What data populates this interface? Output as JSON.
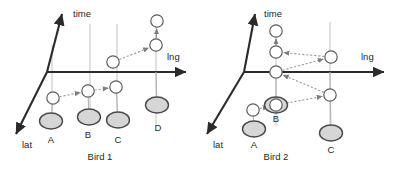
{
  "figure": {
    "title": "",
    "panels": [
      {
        "id": "bird-1",
        "caption": "Bird 1",
        "caption_pos": [
          100,
          160
        ],
        "origin": [
          47,
          72
        ],
        "axes": {
          "time": {
            "label": "time",
            "label_pos": [
              73,
              17
            ],
            "from": [
              47,
              72
            ],
            "to": [
              62,
              14
            ]
          },
          "lng": {
            "label": "lng",
            "label_pos": [
              167,
              60
            ],
            "from": [
              47,
              72
            ],
            "to": [
              186,
              72
            ]
          },
          "lat": {
            "label": "lat",
            "label_pos": [
              22,
              148
            ],
            "from": [
              47,
              72
            ],
            "to": [
              16,
              134
            ]
          }
        },
        "guides": [
          [
            52,
            45,
            52,
            118
          ],
          [
            90,
            24,
            90,
            122
          ],
          [
            117,
            24,
            117,
            124
          ],
          [
            156,
            14,
            156,
            124
          ]
        ],
        "points": [
          {
            "label": "A",
            "label_pos": [
              51,
              143
            ],
            "ground": [
              51,
              121
            ],
            "node": [
              53,
              98
            ],
            "drop": [
              53,
              98,
              51,
              121
            ]
          },
          {
            "label": "B",
            "label_pos": [
              88,
              138
            ],
            "ground": [
              89,
              117
            ],
            "node": [
              88,
              91
            ],
            "drop": [
              88,
              91,
              89,
              117
            ]
          },
          {
            "label": "C",
            "label_pos": [
              118,
              143
            ],
            "ground": [
              118,
              120
            ],
            "node": [
              116,
              87
            ],
            "drop": [
              116,
              87,
              118,
              120
            ]
          },
          {
            "label": "D",
            "label_pos": [
              158,
              131
            ],
            "ground": [
              157,
              105
            ],
            "node": null,
            "drop": [
              156,
              72,
              157,
              105
            ]
          }
        ],
        "traj_nodes": [
          [
            53,
            98
          ],
          [
            88,
            91
          ],
          [
            116,
            87
          ],
          [
            113,
            62
          ],
          [
            156,
            45
          ],
          [
            157,
            21
          ]
        ],
        "traj_segments": [
          {
            "from": [
              53,
              98
            ],
            "to": [
              88,
              91
            ],
            "style": "dotted",
            "arrow": true
          },
          {
            "from": [
              88,
              91
            ],
            "to": [
              116,
              87
            ],
            "style": "dotted",
            "arrow": true
          },
          {
            "from": [
              113,
              62
            ],
            "to": [
              156,
              45
            ],
            "style": "dotted",
            "arrow": true
          },
          {
            "from": [
              156,
              45
            ],
            "to": [
              157,
              21
            ],
            "style": "solid",
            "arrow": true
          }
        ],
        "extra_nodes": [
          [
            113,
            62
          ],
          [
            156,
            45
          ],
          [
            157,
            21
          ]
        ]
      },
      {
        "id": "bird-2",
        "caption": "Bird 2",
        "caption_pos": [
          276,
          160
        ],
        "origin": [
          244,
          72
        ],
        "axes": {
          "time": {
            "label": "time",
            "label_pos": [
              264,
              17
            ],
            "from": [
              244,
              72
            ],
            "to": [
              255,
              14
            ]
          },
          "lng": {
            "label": "lng",
            "label_pos": [
              361,
              60
            ],
            "from": [
              244,
              72
            ],
            "to": [
              384,
              72
            ]
          },
          "lat": {
            "label": "lat",
            "label_pos": [
              213,
              148
            ],
            "from": [
              244,
              72
            ],
            "to": [
              207,
              134
            ]
          }
        },
        "guides": [
          [
            276,
            24,
            276,
            126
          ],
          [
            330,
            22,
            330,
            134
          ]
        ],
        "points": [
          {
            "label": "A",
            "label_pos": [
              254,
              148
            ],
            "ground": [
              254,
              129
            ],
            "node": [
              253,
              110
            ],
            "drop": [
              253,
              110,
              254,
              129
            ]
          },
          {
            "label": "B",
            "label_pos": [
              276,
              122
            ],
            "ground": [
              276,
              105
            ],
            "node": null,
            "drop": [
              276,
              72,
              276,
              105
            ]
          },
          {
            "label": "C",
            "label_pos": [
              331,
              153
            ],
            "ground": [
              331,
              133
            ],
            "node": null,
            "drop": [
              330,
              72,
              331,
              133
            ]
          }
        ],
        "traj_nodes": [
          [
            253,
            110
          ],
          [
            276,
            105
          ],
          [
            330,
            95
          ],
          [
            276,
            72
          ],
          [
            331,
            57
          ],
          [
            276,
            52
          ],
          [
            276,
            31
          ]
        ],
        "traj_segments": [
          {
            "from": [
              253,
              110
            ],
            "to": [
              276,
              105
            ],
            "style": "dotted",
            "arrow": true
          },
          {
            "from": [
              276,
              105
            ],
            "to": [
              330,
              95
            ],
            "style": "dotted",
            "arrow": true
          },
          {
            "from": [
              330,
              95
            ],
            "to": [
              276,
              72
            ],
            "style": "dotted",
            "arrow": true
          },
          {
            "from": [
              276,
              72
            ],
            "to": [
              331,
              57
            ],
            "style": "dotted",
            "arrow": true
          },
          {
            "from": [
              331,
              57
            ],
            "to": [
              276,
              52
            ],
            "style": "dotted",
            "arrow": true
          },
          {
            "from": [
              276,
              52
            ],
            "to": [
              276,
              31
            ],
            "style": "solid",
            "arrow": true
          }
        ],
        "extra_nodes": [
          [
            276,
            105
          ],
          [
            330,
            95
          ],
          [
            276,
            72
          ],
          [
            331,
            57
          ],
          [
            276,
            52
          ],
          [
            276,
            31
          ]
        ]
      }
    ],
    "style": {
      "axis_color": "#2b2b2b",
      "guide_color": "#c9c9c9",
      "node_fill": "#ffffff",
      "node_stroke": "#5d5d5d",
      "ground_fill": "#d6d6d6",
      "ground_stroke": "#4a4a4a",
      "text_color": "#1f1f1f",
      "background": "#ffffff"
    },
    "geometry": {
      "node_r": 6.2,
      "ground_rx": 11.5,
      "ground_ry": 8.0
    }
  }
}
